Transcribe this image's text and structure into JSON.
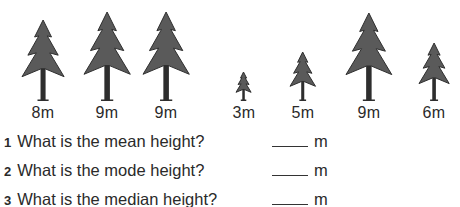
{
  "trees": [
    {
      "height_label": "8m",
      "height": 8,
      "cx": 43,
      "top": 20
    },
    {
      "height_label": "9m",
      "height": 9,
      "cx": 107,
      "top": 12
    },
    {
      "height_label": "9m",
      "height": 9,
      "cx": 166,
      "top": 12
    },
    {
      "height_label": "3m",
      "height": 3,
      "cx": 244,
      "top": 72
    },
    {
      "height_label": "5m",
      "height": 5,
      "cx": 303,
      "top": 52
    },
    {
      "height_label": "9m",
      "height": 9,
      "cx": 369,
      "top": 13
    },
    {
      "height_label": "6m",
      "height": 6,
      "cx": 434,
      "top": 43
    }
  ],
  "questions": [
    {
      "number": "1",
      "text": "What is the mean height?",
      "unit": "m"
    },
    {
      "number": "2",
      "text": "What is the mode height?",
      "unit": "m"
    },
    {
      "number": "3",
      "text": "What is the median height?",
      "unit": "m"
    }
  ],
  "colors": {
    "tree_fill": "#5a5a5a",
    "tree_stroke": "#2e2e2e",
    "text": "#2a2a2a"
  }
}
